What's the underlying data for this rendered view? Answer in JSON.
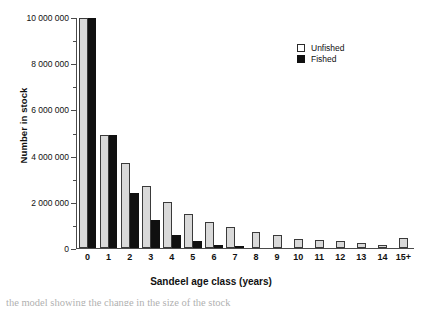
{
  "chart_data": {
    "type": "bar",
    "title": "",
    "xlabel": "Sandeel age class (years)",
    "ylabel": "Number in stock",
    "categories": [
      "0",
      "1",
      "2",
      "3",
      "4",
      "5",
      "6",
      "7",
      "8",
      "9",
      "10",
      "11",
      "12",
      "13",
      "14",
      "15+"
    ],
    "series": [
      {
        "name": "Unfished",
        "color": "#d9d9d9",
        "values": [
          10000000,
          4900000,
          3700000,
          2700000,
          2000000,
          1500000,
          1150000,
          900000,
          700000,
          550000,
          400000,
          350000,
          300000,
          200000,
          120000,
          450000
        ]
      },
      {
        "name": "Fished",
        "color": "#101010",
        "values": [
          10000000,
          4900000,
          2400000,
          1200000,
          550000,
          300000,
          150000,
          80000,
          0,
          0,
          0,
          0,
          0,
          0,
          0,
          0
        ]
      }
    ],
    "ylim": [
      0,
      10000000
    ],
    "yticks": [
      0,
      2000000,
      4000000,
      6000000,
      8000000,
      10000000
    ],
    "ytick_labels": [
      "0",
      "2 000 000",
      "4 000 000",
      "6 000 000",
      "8 000 000",
      "10 000 000"
    ],
    "yminor_ticks": [
      1000000,
      3000000,
      5000000,
      7000000,
      9000000
    ],
    "grid": false,
    "legend_position": "top-right",
    "legend": [
      "Unfished",
      "Fished"
    ]
  },
  "caption": {
    "text": "the model showing the change in the size of the stock"
  }
}
